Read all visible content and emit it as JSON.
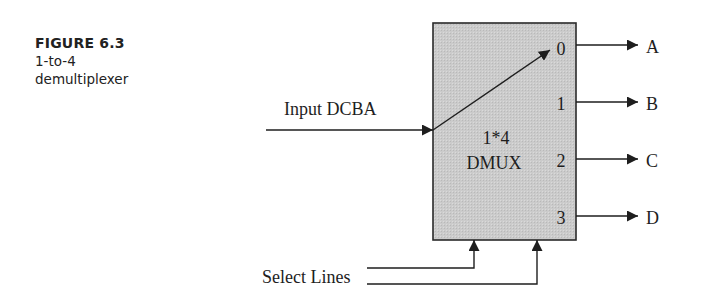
{
  "caption": {
    "figure_number": "FIGURE 6.3",
    "line1": "1-to-4",
    "line2": "demultiplexer"
  },
  "diagram": {
    "block": {
      "label_line1": "1*4",
      "label_line2": "DMUX",
      "fill_color": "#c8c8c8",
      "border_color": "#2a2a2a"
    },
    "input": {
      "label": "Input DCBA"
    },
    "output_pins": [
      "0",
      "1",
      "2",
      "3"
    ],
    "outputs": [
      "A",
      "B",
      "C",
      "D"
    ],
    "select": {
      "label": "Select Lines"
    }
  }
}
